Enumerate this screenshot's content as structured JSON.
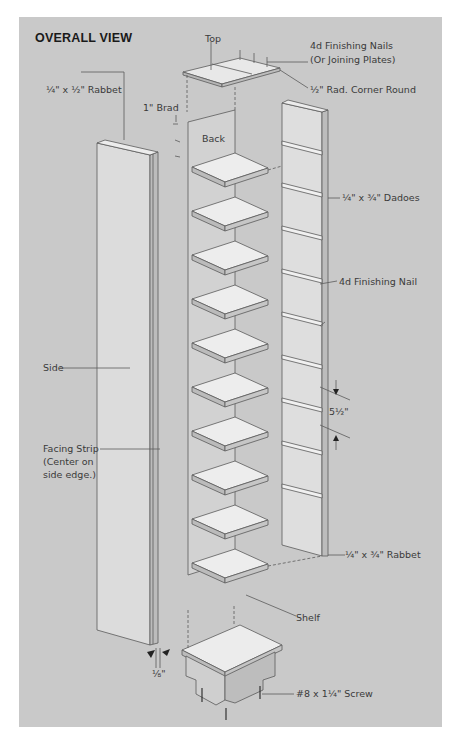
{
  "figure": {
    "title": "OVERALL VIEW",
    "colors": {
      "background": "#c9c9c9",
      "board_face": "#e6e6e6",
      "board_edge": "#b5b5b5",
      "line": "#5a5a5a"
    },
    "labels": {
      "top": "Top",
      "finishing_nails_line1": "4d Finishing Nails",
      "finishing_nails_line2": "(Or Joining Plates)",
      "rabbet_top": "¼\" x ½\" Rabbet",
      "corner_round": "½\" Rad. Corner Round",
      "brad": "1\" Brad",
      "back": "Back",
      "dadoes": "¼\" x ¾\" Dadoes",
      "finishing_nail": "4d Finishing Nail",
      "spacing": "5½\"",
      "side": "Side",
      "facing_strip_line1": "Facing Strip",
      "facing_strip_line2": "(Center on",
      "facing_strip_line3": "side edge.)",
      "rabbet_bottom": "¼\" x ¾\" Rabbet",
      "shelf": "Shelf",
      "offset": "⅛\"",
      "screw": "#8 x 1¼\" Screw"
    },
    "shelf_count": 10
  }
}
